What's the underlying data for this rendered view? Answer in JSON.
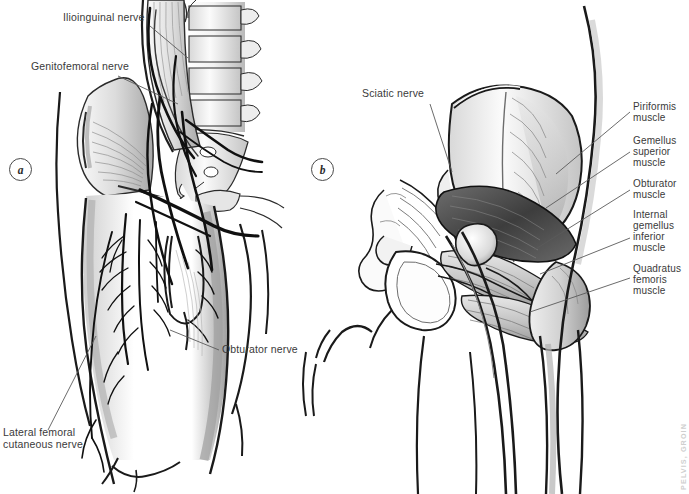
{
  "figure": {
    "background_color": "#ffffff",
    "ink_color": "#1a1a1a",
    "label_color": "#3a3a3a",
    "leader_color": "#5a5a5a",
    "watermark": "PELVIS, GROIN"
  },
  "panels": [
    {
      "id": "a",
      "marker": "a",
      "caption": "Anterior view of the lumbar plexus, psoas major and iliacus with nerves of the groin",
      "labels": [
        {
          "name": "ilioinguinal-nerve",
          "text": "Ilioinguinal nerve"
        },
        {
          "name": "genitofemoral-nerve",
          "text": "Genitofemoral nerve"
        },
        {
          "name": "obturator-nerve",
          "text": "Obturator nerve"
        },
        {
          "name": "lateral-femoral-cutaneous-nerve",
          "text_line1": "Lateral femoral",
          "text_line2": "cutaneous nerve"
        }
      ]
    },
    {
      "id": "b",
      "marker": "b",
      "caption": "Posterior view of the hip showing the sciatic nerve and the short external rotator muscles",
      "labels": [
        {
          "name": "sciatic-nerve",
          "text": "Sciatic nerve"
        },
        {
          "name": "piriformis-muscle",
          "line1": "Piriformis",
          "line2": "muscle"
        },
        {
          "name": "gemellus-superior-muscle",
          "line1": "Gemellus",
          "line2": "superior",
          "line3": "muscle"
        },
        {
          "name": "obturator-muscle",
          "line1": "Obturator",
          "line2": "muscle"
        },
        {
          "name": "internal-gemellus-inferior-muscle",
          "line1": "Internal",
          "line2": "gemellus",
          "line3": "inferior",
          "line4": "muscle"
        },
        {
          "name": "quadratus-femoris-muscle",
          "line1": "Quadratus",
          "line2": "femoris",
          "line3": "muscle"
        }
      ]
    }
  ]
}
